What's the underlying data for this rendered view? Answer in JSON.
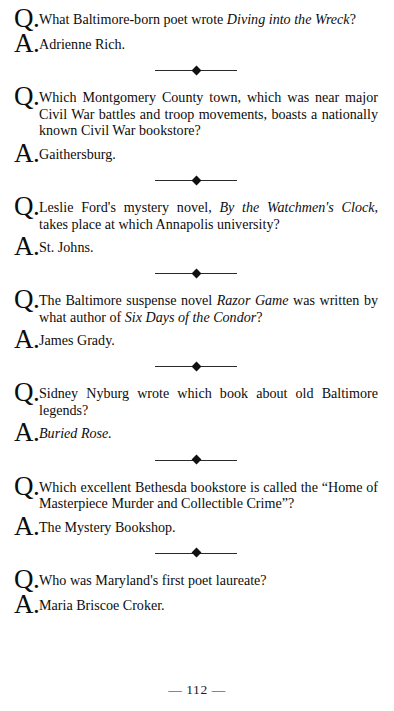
{
  "page": {
    "number_label": "— 112 —",
    "marker_question": "Q.",
    "marker_answer": "A."
  },
  "entries": [
    {
      "question_html": "What Baltimore-born poet wrote <i>Diving into the Wreck</i>?",
      "answer_html": "Adrienne Rich.",
      "separator_after": true
    },
    {
      "question_html": "Which Montgomery County town, which was near major Civil War battles and troop movements, boasts a nationally known Civil War bookstore?",
      "answer_html": "Gaithersburg.",
      "separator_after": true
    },
    {
      "question_html": "Leslie Ford's mystery novel, <i>By the Watchmen's Clock</i>, takes place at which Annapolis university?",
      "answer_html": "St. Johns.",
      "separator_after": true
    },
    {
      "question_html": "The Baltimore suspense novel <i>Razor Game</i> was written by what author of <i>Six Days of the Condor</i>?",
      "answer_html": "James Grady.",
      "separator_after": true
    },
    {
      "question_html": "Sidney Nyburg wrote which book about old Baltimore legends?",
      "answer_html": "<i>Buried Rose.</i>",
      "separator_after": true
    },
    {
      "question_html": "Which excellent Bethesda bookstore is called the “Home of Masterpiece Murder and Collectible Crime”?",
      "answer_html": "The Mystery Bookshop.",
      "separator_after": true
    },
    {
      "question_html": "Who was Maryland's first poet laureate?",
      "answer_html": "Maria Briscoe Croker.",
      "separator_after": false
    }
  ]
}
